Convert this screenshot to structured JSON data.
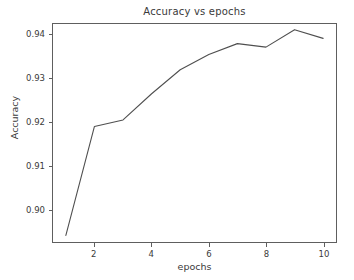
{
  "chart_data": {
    "type": "line",
    "title": "Accuracy vs epochs",
    "xlabel": "epochs",
    "ylabel": "Accuracy",
    "x": [
      1,
      2,
      3,
      4,
      5,
      6,
      7,
      8,
      9,
      10
    ],
    "values": [
      0.894,
      0.919,
      0.9205,
      0.9265,
      0.932,
      0.9355,
      0.938,
      0.9372,
      0.9412,
      0.9392
    ],
    "series": [
      {
        "name": "Accuracy",
        "values": [
          0.894,
          0.919,
          0.9205,
          0.9265,
          0.932,
          0.9355,
          0.938,
          0.9372,
          0.9412,
          0.9392
        ]
      }
    ],
    "xlim": [
      0.55,
      10.45
    ],
    "ylim": [
      0.8925,
      0.9425
    ],
    "xticks": [
      2,
      4,
      6,
      8,
      10
    ],
    "xtick_labels": [
      "2",
      "4",
      "6",
      "8",
      "10"
    ],
    "yticks": [
      0.9,
      0.91,
      0.92,
      0.93,
      0.94
    ],
    "ytick_labels": [
      "0.90",
      "0.91",
      "0.92",
      "0.93",
      "0.94"
    ],
    "grid": false,
    "legend": null,
    "line_color": "#4f4f4f",
    "background_color": "#ffffff",
    "axis_color": "#5e5e5e",
    "text_color": "#3a3a3a"
  }
}
